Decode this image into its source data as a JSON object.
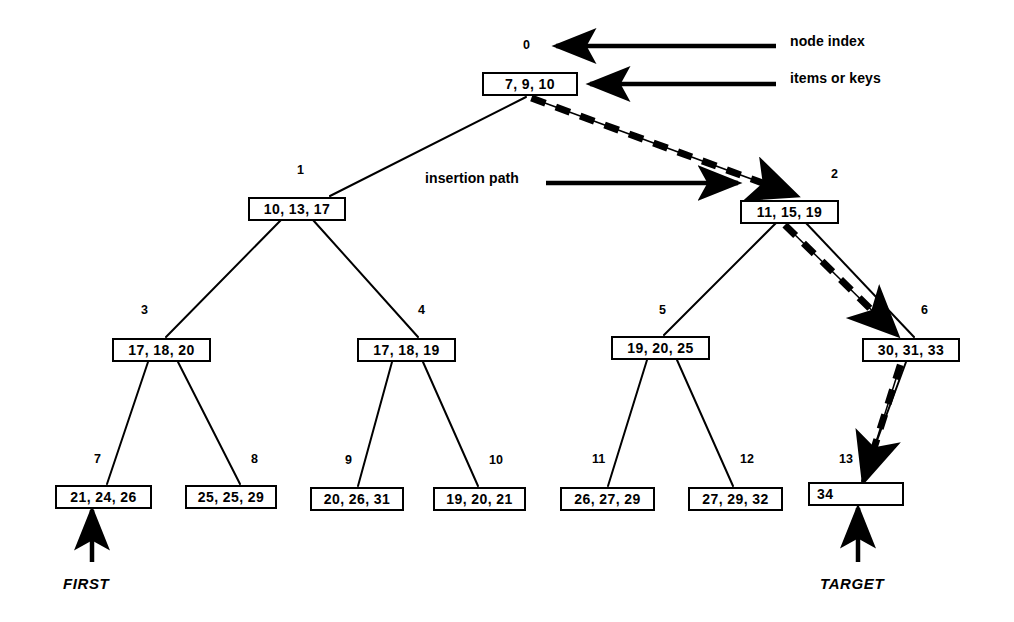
{
  "diagram": {
    "stroke_color": "#000000",
    "background_color": "#ffffff",
    "nodes": [
      {
        "index": "0",
        "items": "7, 9, 10",
        "x": 482,
        "y": 72,
        "w": 96,
        "index_x": 523,
        "index_y": 38,
        "align": "center"
      },
      {
        "index": "1",
        "items": "10, 13, 17",
        "x": 248,
        "y": 197,
        "w": 98,
        "index_x": 297,
        "index_y": 163,
        "align": "center"
      },
      {
        "index": "2",
        "items": "11, 15, 19",
        "x": 740,
        "y": 200,
        "w": 99,
        "index_x": 831,
        "index_y": 167,
        "align": "center"
      },
      {
        "index": "3",
        "items": "17, 18, 20",
        "x": 112,
        "y": 338,
        "w": 99,
        "index_x": 141,
        "index_y": 303,
        "align": "center"
      },
      {
        "index": "4",
        "items": "17, 18, 19",
        "x": 357,
        "y": 338,
        "w": 99,
        "index_x": 418,
        "index_y": 303,
        "align": "center"
      },
      {
        "index": "5",
        "items": "19, 20, 25",
        "x": 611,
        "y": 336,
        "w": 99,
        "index_x": 659,
        "index_y": 303,
        "align": "center"
      },
      {
        "index": "6",
        "items": "30, 31, 33",
        "x": 862,
        "y": 338,
        "w": 98,
        "index_x": 921,
        "index_y": 303,
        "align": "center"
      },
      {
        "index": "7",
        "items": "21, 24, 26",
        "x": 55,
        "y": 485,
        "w": 97,
        "index_x": 94,
        "index_y": 452,
        "align": "center"
      },
      {
        "index": "8",
        "items": "25, 25, 29",
        "x": 185,
        "y": 485,
        "w": 92,
        "index_x": 251,
        "index_y": 452,
        "align": "center"
      },
      {
        "index": "9",
        "items": "20, 26, 31",
        "x": 310,
        "y": 487,
        "w": 94,
        "index_x": 345,
        "index_y": 453,
        "align": "center"
      },
      {
        "index": "10",
        "items": "19, 20, 21",
        "x": 433,
        "y": 487,
        "w": 93,
        "index_x": 489,
        "index_y": 453,
        "align": "center"
      },
      {
        "index": "11",
        "items": "26, 27, 29",
        "x": 560,
        "y": 487,
        "w": 95,
        "index_x": 592,
        "index_y": 452,
        "align": "center"
      },
      {
        "index": "12",
        "items": "27, 29, 32",
        "x": 688,
        "y": 487,
        "w": 95,
        "index_x": 740,
        "index_y": 452,
        "align": "center"
      },
      {
        "index": "13",
        "items": "34",
        "x": 808,
        "y": 482,
        "w": 96,
        "index_x": 839,
        "index_y": 452,
        "align": "left"
      }
    ],
    "callouts": [
      {
        "name": "node-index-callout",
        "text": "node index",
        "x": 790,
        "y": 33
      },
      {
        "name": "items-callout",
        "text": "items  or keys",
        "x": 790,
        "y": 70
      },
      {
        "name": "insertion-path-callout",
        "text": "insertion path",
        "x": 425,
        "y": 170
      }
    ],
    "pointer_labels": [
      {
        "name": "first-label",
        "text": "FIRST",
        "x": 63,
        "y": 575
      },
      {
        "name": "target-label",
        "text": "TARGET",
        "x": 820,
        "y": 575
      }
    ],
    "edges": [
      {
        "from": "0",
        "to": "1",
        "x1": 526,
        "y1": 97,
        "x2": 330,
        "y2": 196
      },
      {
        "from": "1",
        "to": "3",
        "x1": 281,
        "y1": 220,
        "x2": 166,
        "y2": 337
      },
      {
        "from": "1",
        "to": "4",
        "x1": 313,
        "y1": 220,
        "x2": 418,
        "y2": 337
      },
      {
        "from": "3",
        "to": "7",
        "x1": 148,
        "y1": 362,
        "x2": 107,
        "y2": 484
      },
      {
        "from": "3",
        "to": "8",
        "x1": 178,
        "y1": 362,
        "x2": 240,
        "y2": 484
      },
      {
        "from": "4",
        "to": "9",
        "x1": 392,
        "y1": 362,
        "x2": 358,
        "y2": 486
      },
      {
        "from": "4",
        "to": "10",
        "x1": 423,
        "y1": 362,
        "x2": 478,
        "y2": 486
      },
      {
        "from": "2",
        "to": "5",
        "x1": 776,
        "y1": 223,
        "x2": 664,
        "y2": 335
      },
      {
        "from": "2",
        "to": "6",
        "x1": 806,
        "y1": 223,
        "x2": 914,
        "y2": 337
      },
      {
        "from": "5",
        "to": "11",
        "x1": 647,
        "y1": 360,
        "x2": 608,
        "y2": 486
      },
      {
        "from": "5",
        "to": "12",
        "x1": 677,
        "y1": 360,
        "x2": 733,
        "y2": 486
      },
      {
        "from": "6",
        "to": "13",
        "x1": 906,
        "y1": 362,
        "x2": 862,
        "y2": 481
      }
    ],
    "insertion_path_edges": [
      {
        "from": "0",
        "to": "2",
        "x1": 534,
        "y1": 99,
        "x2": 795,
        "y2": 195
      },
      {
        "from": "2",
        "to": "6",
        "x1": 786,
        "y1": 226,
        "x2": 896,
        "y2": 334
      },
      {
        "from": "6",
        "to": "13",
        "x1": 900,
        "y1": 366,
        "x2": 864,
        "y2": 480
      }
    ],
    "annotation_arrows": [
      {
        "name": "node-index-arrow",
        "x1": 776,
        "y1": 46,
        "x2": 556,
        "y2": 46
      },
      {
        "name": "items-arrow",
        "x1": 776,
        "y1": 84,
        "x2": 590,
        "y2": 84
      },
      {
        "name": "insertion-path-arrow",
        "x1": 546,
        "y1": 183,
        "x2": 738,
        "y2": 183
      },
      {
        "name": "first-arrow",
        "x1": 92,
        "y1": 562,
        "x2": 92,
        "y2": 510
      },
      {
        "name": "target-arrow",
        "x1": 858,
        "y1": 562,
        "x2": 858,
        "y2": 508
      }
    ]
  }
}
